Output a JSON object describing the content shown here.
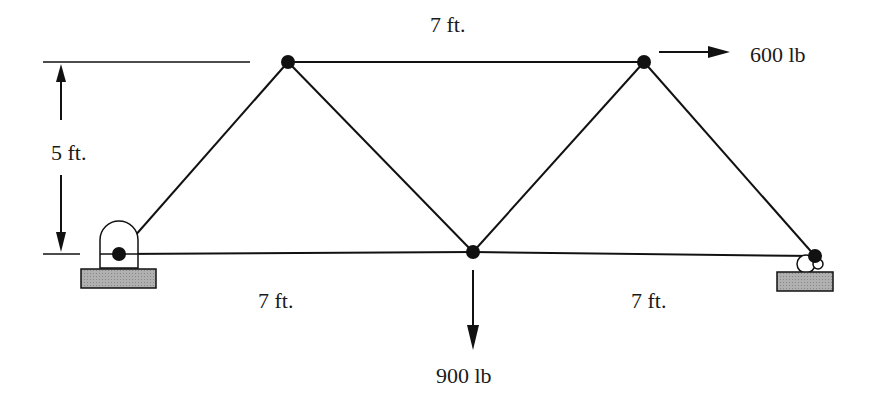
{
  "diagram": {
    "type": "truss",
    "nodes": [
      {
        "id": "A",
        "x": 119,
        "y": 254,
        "support": "pin"
      },
      {
        "id": "B",
        "x": 288,
        "y": 62
      },
      {
        "id": "C",
        "x": 473,
        "y": 252
      },
      {
        "id": "D",
        "x": 644,
        "y": 62
      },
      {
        "id": "E",
        "x": 815,
        "y": 256,
        "support": "roller"
      }
    ],
    "members": [
      [
        "A",
        "B"
      ],
      [
        "B",
        "D"
      ],
      [
        "A",
        "C"
      ],
      [
        "C",
        "E"
      ],
      [
        "B",
        "C"
      ],
      [
        "C",
        "D"
      ],
      [
        "D",
        "E"
      ]
    ],
    "colors": {
      "line": "#111111",
      "support_fill": "#a6a6a6"
    }
  },
  "labels": {
    "top_span": "7 ft.",
    "height": "5 ft.",
    "bottom_left_span": "7 ft.",
    "bottom_right_span": "7 ft."
  },
  "loads": {
    "horizontal": "600 lb",
    "vertical": "900 lb"
  }
}
